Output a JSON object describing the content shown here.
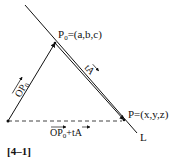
{
  "figure": {
    "label": "[4–1]",
    "line_label": "L",
    "p0_label_prefix": "P",
    "p0_label_sub": "0",
    "p0_label_rest": "=(a,b,c)",
    "p_label": "P=(x,y,z)",
    "op0_vec_main": "OP",
    "op0_vec_sub": "0",
    "ta_vec_t": "t",
    "ta_vec_a": "A",
    "sum_vec_op": "OP",
    "sum_vec_sub": "0",
    "sum_vec_rest": "+t",
    "sum_vec_a": "A"
  },
  "colors": {
    "stroke": "#111111",
    "background": "#ffffff"
  }
}
